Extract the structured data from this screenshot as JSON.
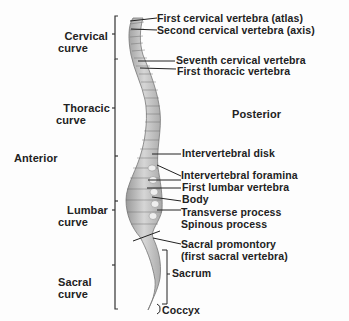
{
  "diagram": {
    "orientation": {
      "anterior": "Anterior",
      "posterior": "Posterior"
    },
    "curves": [
      {
        "line1": "Cervical",
        "line2": "curve"
      },
      {
        "line1": "Thoracic",
        "line2": "curve"
      },
      {
        "line1": "Lumbar",
        "line2": "curve"
      },
      {
        "line1": "Sacral",
        "line2": "curve"
      }
    ],
    "labels": [
      "First cervical vertebra (atlas)",
      "Second cervical vertebra (axis)",
      "Seventh cervical vertebra",
      "First thoracic vertebra",
      "Intervertebral disk",
      "Intervertebral foramina",
      "First lumbar vertebra",
      "Body",
      "Transverse process",
      "Spinous process",
      "Sacral promontory",
      "(first sacral vertebra)",
      "Sacrum",
      "Coccyx"
    ],
    "colors": {
      "text": "#222222",
      "bone_light": "#cfcfcf",
      "bone_dark": "#8a8a8a",
      "line": "#222222"
    }
  }
}
